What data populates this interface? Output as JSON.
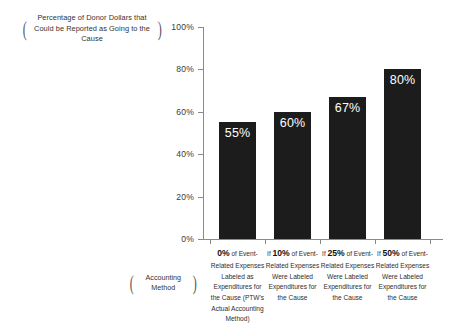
{
  "chart_data": {
    "type": "bar",
    "title": "",
    "ylabel": "Percentage of Donor Dollars that Could be Reported as Going to the Cause",
    "xlabel": "Accounting Method",
    "ylim": [
      0,
      100
    ],
    "yticks": [
      "0%",
      "20%",
      "40%",
      "60%",
      "80%",
      "100%"
    ],
    "ytick_values": [
      0,
      20,
      40,
      60,
      80,
      100
    ],
    "grid": false,
    "legend": "none",
    "categories": [
      "0% of Event-Related Expenses Labeled as Expenditures for the Cause (PTW's Actual Accounting Method)",
      "If 10% of Event-Related Expenses Were Labeled Expenditures for the Cause",
      "If 25% of Event-Related Expenses Were Labeled Expenditures for the Cause",
      "If 50% of Event-Related Expenses Were Labeled Expenditures for the Cause"
    ],
    "values": [
      55,
      60,
      67,
      80
    ],
    "value_labels": [
      "55%",
      "60%",
      "67%",
      "80%"
    ],
    "bar_color": "#1c1c1c",
    "value_label_color": "#ffffff",
    "axis_color": "#8a8a8a"
  },
  "category_labels": [
    {
      "lead": "0%",
      "lead_suffix": " of",
      "prefix": "",
      "rest": "Event-Related Expenses Labeled as Expenditures for the Cause (PTW's Actual Accounting Method)"
    },
    {
      "lead": "10%",
      "lead_suffix": "",
      "prefix": "If ",
      "rest": "of Event-Related Expenses Were Labeled Expenditures for the Cause"
    },
    {
      "lead": "25%",
      "lead_suffix": "",
      "prefix": "If ",
      "rest": "of Event-Related Expenses Were Labeled Expenditures for the Cause"
    },
    {
      "lead": "50%",
      "lead_suffix": "",
      "prefix": "If ",
      "rest": "of Event-Related Expenses Were Labeled Expenditures for the Cause"
    }
  ],
  "brackets": {
    "open": "(",
    "close": ")"
  }
}
